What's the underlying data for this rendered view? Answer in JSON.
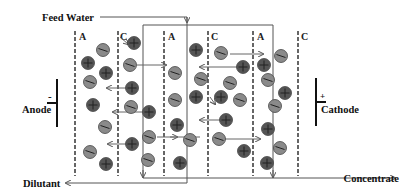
{
  "diagram": {
    "labels": {
      "feed_water": "Feed Water",
      "dilutant": "Dilutant",
      "concentrate": "Concentrate",
      "anode": "Anode",
      "anode_sign": "-",
      "cathode": "Cathode",
      "cathode_sign": "+"
    },
    "membranes": [
      {
        "type": "A",
        "x": 75
      },
      {
        "type": "C",
        "x": 118
      },
      {
        "type": "A",
        "x": 164
      },
      {
        "type": "C",
        "x": 208
      },
      {
        "type": "A",
        "x": 253
      },
      {
        "type": "C",
        "x": 298
      }
    ],
    "ion_legend": {
      "cation": "circle with plus (+)",
      "anion": "circle with minus (-)"
    },
    "colors": {
      "cation_fill": "#555555",
      "anion_fill": "#8a8a8a",
      "membrane": "#666666",
      "text": "#111111"
    }
  }
}
